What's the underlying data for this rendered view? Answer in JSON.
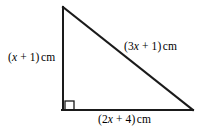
{
  "figure": {
    "name": "right-triangle-diagram",
    "background_color": "#ffffff",
    "stroke_color": "#1a1a1a",
    "stroke_width": 2,
    "width": 201,
    "height": 130
  },
  "shape": {
    "type": "right-triangle",
    "vertices": {
      "apex": {
        "x": 63,
        "y": 7
      },
      "right_angle": {
        "x": 63,
        "y": 110
      },
      "right_vertex": {
        "x": 193,
        "y": 110
      }
    },
    "right_angle_marker": {
      "x": 64,
      "y": 100,
      "size": 10,
      "at_vertex": "bottom-left"
    }
  },
  "labels": {
    "vertical_side": {
      "full_text": "(x + 1)cm",
      "open_paren": "(",
      "variable": "x",
      "rest": " + 1)",
      "unit": "cm"
    },
    "hypotenuse": {
      "full_text": "(3x + 1)cm",
      "open_paren": "(3",
      "variable": "x",
      "rest": " + 1)",
      "unit": "cm"
    },
    "base": {
      "full_text": "(2x + 4)cm",
      "open_paren": "(2",
      "variable": "x",
      "rest": " + 4)",
      "unit": "cm"
    }
  }
}
